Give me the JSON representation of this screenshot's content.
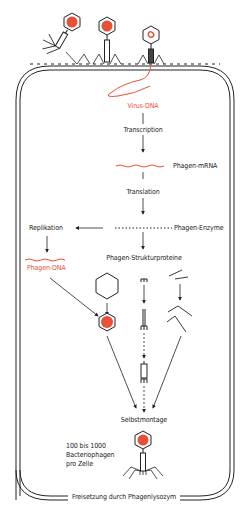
{
  "colors": {
    "ink": "#222222",
    "accent_red": "#e8503a",
    "capsid_fill": "#e8503a",
    "background": "#ffffff"
  },
  "labels": {
    "virus_dna": "Virus-DNA",
    "transcription": "Transcription",
    "phagen_mrna": "Phagen-mRNA",
    "translation": "Translation",
    "replikation": "Replikation",
    "phagen_enzyme": "Phagen-Enzyme",
    "phagen_dna": "Phagen-DNA",
    "phagen_strukturproteine": "Phagen-Strukturproteine",
    "selbstmontage": "Selbstmontage",
    "yield_line1": "100 bis 1000",
    "yield_line2": "Bacteriophagen",
    "yield_line3": "pro Zelle",
    "freisetzung": "Freisetzung durch Phagenlysozym"
  },
  "icons": [
    "bacteriophage-icon",
    "capsid-hexagon-icon",
    "tail-tube-icon",
    "tail-fiber-icon",
    "dna-strand-icon",
    "mrna-wave-icon",
    "enzyme-chain-icon",
    "arrow-icon"
  ]
}
